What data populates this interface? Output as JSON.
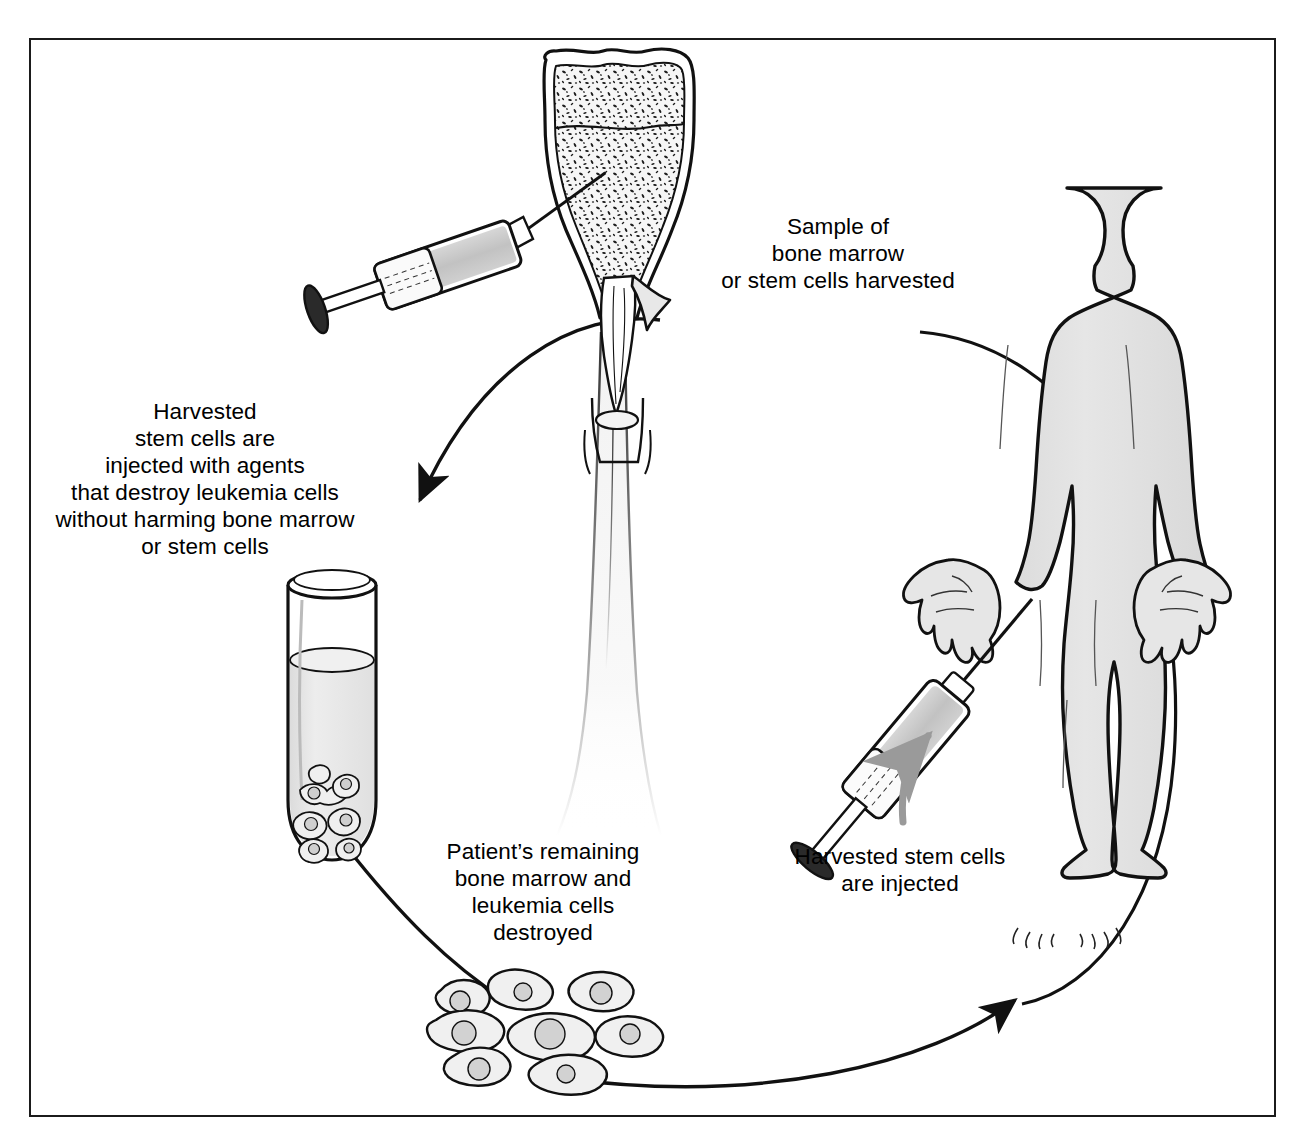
{
  "diagram": {
    "frame": {
      "present": true,
      "stroke": "#1b1b1b"
    },
    "labels": [
      {
        "id": "sample-harvested",
        "text": "Sample of\nbone marrow\nor stem cells harvested",
        "x": 688,
        "y": 213,
        "width": 300,
        "align": "center"
      },
      {
        "id": "cells-treated",
        "text": "Harvested\nstem cells are\ninjected with agents\nthat destroy leukemia cells\nwithout harming bone marrow\nor stem cells",
        "x": 30,
        "y": 398,
        "width": 350,
        "align": "center"
      },
      {
        "id": "marrow-destroyed",
        "text": "Patient’s remaining\nbone marrow and\nleukemia cells\ndestroyed",
        "x": 413,
        "y": 838,
        "width": 260,
        "align": "center"
      },
      {
        "id": "cells-injected",
        "text": "Harvested stem cells\nare injected",
        "x": 770,
        "y": 843,
        "width": 260,
        "align": "center"
      }
    ],
    "illustrations": [
      {
        "id": "femur-bone",
        "label": "cut-away long bone with spongy marrow",
        "x": 520,
        "y": 45
      },
      {
        "id": "aspiration-syringe",
        "label": "syringe drawing marrow from bone",
        "x": 318,
        "y": 280
      },
      {
        "id": "test-tube",
        "label": "test tube of treated stem cells",
        "x": 268,
        "y": 565
      },
      {
        "id": "destroyed-cells",
        "label": "cluster of destroyed marrow and leukemia cells",
        "x": 430,
        "y": 965
      },
      {
        "id": "patient-body",
        "label": "standing human body silhouette",
        "x": 880,
        "y": 180
      },
      {
        "id": "injection-syringe",
        "label": "syringe injecting stem cells into patient",
        "x": 790,
        "y": 565
      },
      {
        "id": "motion-arrow",
        "label": "gray curved motion arrow",
        "x": 905,
        "y": 720
      }
    ],
    "flow_arrows": [
      {
        "id": "arrow-bone-to-tube",
        "from": "femur-bone",
        "to": "test-tube",
        "direction": "down-left"
      },
      {
        "id": "arrow-tube-to-cells",
        "from": "test-tube",
        "to": "destroyed-cells",
        "direction": "down-right"
      },
      {
        "id": "arrow-cells-to-patient",
        "from": "destroyed-cells",
        "to": "patient-body",
        "direction": "up-right"
      }
    ],
    "colors": {
      "outline": "#111111",
      "body_fill": "#e3e3e3",
      "bone_fill": "#f3f3f3",
      "fluid_fill": "#e8e8e8",
      "syringe_fluid": "#c9c9c9",
      "motion_arrow": "#9a9a9a",
      "background": "#ffffff"
    }
  }
}
